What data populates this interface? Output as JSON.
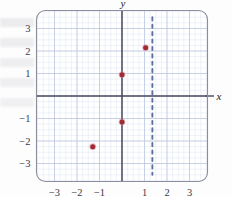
{
  "chart_data": {
    "type": "scatter",
    "title": "",
    "xlabel": "x",
    "ylabel": "y",
    "xlim": [
      -3.8,
      3.8
    ],
    "ylim": [
      -3.8,
      3.8
    ],
    "grid": true,
    "minor_grid": true,
    "minor_step": 0.25,
    "major_step": 1,
    "legend": "none",
    "x_ticks": [
      -3,
      -2,
      -1,
      1,
      2,
      3
    ],
    "x_tick_labels": [
      "−3",
      "−2",
      "−1",
      "1",
      "2",
      "3"
    ],
    "y_ticks": [
      3,
      2,
      1,
      -1,
      -2,
      -3
    ],
    "y_tick_labels": [
      "3",
      "2",
      "1",
      "−1",
      "−2",
      "−3"
    ],
    "series": [
      {
        "name": "plotted points",
        "type": "scatter",
        "marker": "filled-circle",
        "color": "#9e2b35",
        "points": [
          {
            "x": 1.05,
            "y": 2.15
          },
          {
            "x": 0.0,
            "y": 0.95
          },
          {
            "x": 0.0,
            "y": -1.15
          },
          {
            "x": -1.3,
            "y": -2.25
          }
        ]
      },
      {
        "name": "vertical dashed line",
        "type": "line",
        "style": "dashed",
        "color": "#5d6f9e",
        "x_value": 1.35,
        "y_from": -3.5,
        "y_to": 3.5
      }
    ],
    "axis_color": "#45455a",
    "grid_major_color": "#b9c4dd",
    "grid_minor_color": "#dde4f0",
    "frame_color": "#8d8d9e"
  },
  "labels": {
    "x_axis": "x",
    "y_axis": "y"
  }
}
